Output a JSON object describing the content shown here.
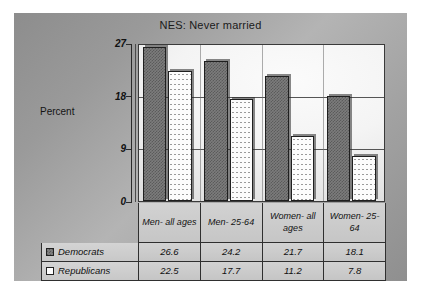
{
  "chart_data": {
    "type": "bar",
    "title": "NES: Never married",
    "xlabel": "",
    "ylabel": "Percent",
    "ylim": [
      0,
      27
    ],
    "yticks": [
      0,
      9,
      18,
      27
    ],
    "ytick_labels": [
      "0",
      "9",
      "18",
      "27"
    ],
    "grid": true,
    "legend_position": "bottom-table",
    "categories": [
      "Men- all ages",
      "Men- 25-64",
      "Women- all ages",
      "Women- 25-64"
    ],
    "series": [
      {
        "name": "Democrats",
        "values": [
          26.6,
          24.2,
          21.7,
          18.1
        ],
        "swatch": "dem",
        "color": "#7c7c7c"
      },
      {
        "name": "Republicans",
        "values": [
          22.5,
          17.7,
          11.2,
          7.8
        ],
        "swatch": "rep",
        "color": "#fcfcfc"
      }
    ]
  },
  "colors": {
    "panel_background": "#9a9a9a",
    "plot_background": "#f4f4f4",
    "democrats_fill": "#7c7c7c",
    "republicans_fill": "#fcfcfc",
    "border": "#2f2f2f",
    "gridline": "#555555"
  }
}
